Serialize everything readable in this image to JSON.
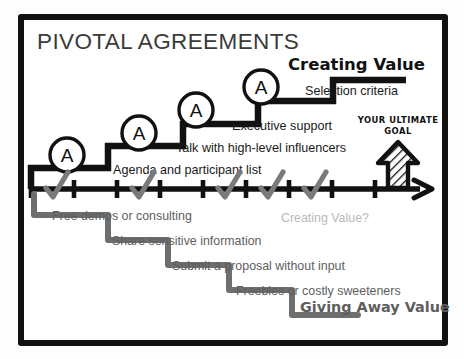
{
  "card": {
    "title": "PIVOTAL AGREEMENTS",
    "border_color": "#111111",
    "background": "#ffffff"
  },
  "upper_path": {
    "heading": "Creating Value",
    "heading_color": "#111111",
    "stair_color": "#111111",
    "marker_label": "A",
    "markers": [
      {
        "label": "A"
      },
      {
        "label": "A"
      },
      {
        "label": "A"
      },
      {
        "label": "A"
      }
    ],
    "steps": [
      {
        "label": "Agenda and participant list"
      },
      {
        "label": "Talk with high-level influencers"
      },
      {
        "label": "Executive support"
      },
      {
        "label": "Selection criteria"
      }
    ]
  },
  "goal": {
    "line1": "YOUR ULTIMATE",
    "line2": "GOAL",
    "icon": "up-arrow-icon",
    "color": "#111111"
  },
  "axis": {
    "tick_count": 9,
    "check_count": 5,
    "color": "#111111",
    "check_color": "#7a7a7a",
    "arrow": "right-arrow-icon"
  },
  "lower_path": {
    "question": "Creating Value?",
    "question_color": "#b9b9b9",
    "stair_color": "#6e6e6e",
    "heading": "Giving Away Value",
    "heading_color": "#5e5e5e",
    "steps": [
      {
        "label": "Free demos or consulting"
      },
      {
        "label": "Share sensitive information"
      },
      {
        "label": "Submit a proposal without input"
      },
      {
        "label": "Freebies or costly sweeteners"
      }
    ]
  }
}
